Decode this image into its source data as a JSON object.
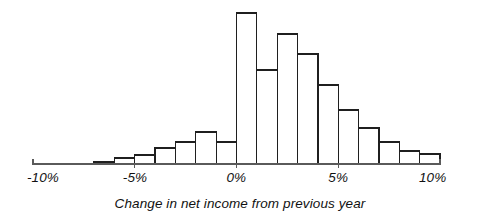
{
  "chart_data": {
    "type": "bar",
    "title": "",
    "subtitle": "",
    "xlabel": "Change in net income from previous year",
    "ylabel": "",
    "grid": false,
    "legend": null,
    "xlim": [
      -10,
      10
    ],
    "ylim": [
      0,
      151
    ],
    "bin_width": 1,
    "x_tick_labels": [
      "-10%",
      "-5%",
      "0%",
      "5%",
      "10%"
    ],
    "x_tick_values": [
      -10,
      -5,
      0,
      5,
      10
    ],
    "y_axis_visible": false,
    "bin_edges": [
      -10,
      -9,
      -8,
      -7,
      -6,
      -5,
      -4,
      -3,
      -2,
      -1,
      0,
      1,
      2,
      3,
      4,
      5,
      6,
      7,
      8,
      9,
      10
    ],
    "categories": [
      "-10% to -9%",
      "-9% to -8%",
      "-8% to -7%",
      "-7% to -6%",
      "-6% to -5%",
      "-5% to -4%",
      "-4% to -3%",
      "-3% to -2%",
      "-2% to -1%",
      "-1% to 0%",
      "0% to 1%",
      "1% to 2%",
      "2% to 3%",
      "3% to 4%",
      "4% to 5%",
      "5% to 6%",
      "6% to 7%",
      "7% to 8%",
      "8% to 9%",
      "9% to 10%"
    ],
    "values": [
      0,
      0,
      0,
      2,
      6,
      9,
      16,
      22,
      32,
      22,
      151,
      94,
      130,
      110,
      79,
      54,
      36,
      22,
      13,
      10
    ],
    "bar_fill_color": "#ffffff",
    "bar_stroke_color": "#1f1f1f",
    "axis_color": "#5a5a5a",
    "text_color": "#111111",
    "background_color": "#ffffff"
  },
  "axis": {
    "caption": "Change in net income from previous year",
    "ticks": [
      {
        "label": "-10%",
        "value": -10
      },
      {
        "label": "-5%",
        "value": -5
      },
      {
        "label": "0%",
        "value": 0
      },
      {
        "label": "5%",
        "value": 5
      },
      {
        "label": "10%",
        "value": 10
      }
    ]
  }
}
